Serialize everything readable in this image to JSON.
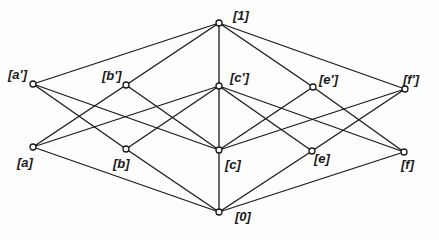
{
  "diagram": {
    "type": "lattice (Hasse diagram)",
    "colors": {
      "line": "#1a1a1a",
      "node_fill": "#ffffff",
      "background": "#fdfdfd"
    },
    "nodes": [
      {
        "id": "one",
        "label": "[1]",
        "x": 219,
        "y": 23,
        "lx": 233,
        "ly": 9
      },
      {
        "id": "ap",
        "label": "[a']",
        "x": 33,
        "y": 84,
        "lx": 8,
        "ly": 68
      },
      {
        "id": "bp",
        "label": "[b']",
        "x": 126,
        "y": 85,
        "lx": 102,
        "ly": 69
      },
      {
        "id": "cp",
        "label": "[c']",
        "x": 219,
        "y": 86,
        "lx": 230,
        "ly": 71
      },
      {
        "id": "ep",
        "label": "[e']",
        "x": 313,
        "y": 87,
        "lx": 319,
        "ly": 73
      },
      {
        "id": "fp",
        "label": "[f']",
        "x": 405,
        "y": 89,
        "lx": 403,
        "ly": 73
      },
      {
        "id": "a",
        "label": "[a]",
        "x": 33,
        "y": 147,
        "lx": 17,
        "ly": 156
      },
      {
        "id": "b",
        "label": "[b]",
        "x": 126,
        "y": 149,
        "lx": 113,
        "ly": 157
      },
      {
        "id": "c",
        "label": "[c]",
        "x": 219,
        "y": 150,
        "lx": 225,
        "ly": 158
      },
      {
        "id": "e",
        "label": "[e]",
        "x": 312,
        "y": 151,
        "lx": 314,
        "ly": 152
      },
      {
        "id": "f",
        "label": "[f]",
        "x": 404,
        "y": 152,
        "lx": 401,
        "ly": 158
      },
      {
        "id": "zero",
        "label": "[0]",
        "x": 219,
        "y": 212,
        "lx": 235,
        "ly": 210
      }
    ],
    "edges": [
      [
        "one",
        "ap"
      ],
      [
        "one",
        "bp"
      ],
      [
        "one",
        "cp"
      ],
      [
        "one",
        "ep"
      ],
      [
        "one",
        "fp"
      ],
      [
        "ap",
        "b"
      ],
      [
        "ap",
        "c"
      ],
      [
        "bp",
        "a"
      ],
      [
        "bp",
        "c"
      ],
      [
        "cp",
        "a"
      ],
      [
        "cp",
        "b"
      ],
      [
        "cp",
        "c"
      ],
      [
        "cp",
        "e"
      ],
      [
        "cp",
        "f"
      ],
      [
        "ep",
        "c"
      ],
      [
        "ep",
        "f"
      ],
      [
        "fp",
        "c"
      ],
      [
        "fp",
        "e"
      ],
      [
        "zero",
        "a"
      ],
      [
        "zero",
        "b"
      ],
      [
        "zero",
        "c"
      ],
      [
        "zero",
        "e"
      ],
      [
        "zero",
        "f"
      ]
    ]
  }
}
